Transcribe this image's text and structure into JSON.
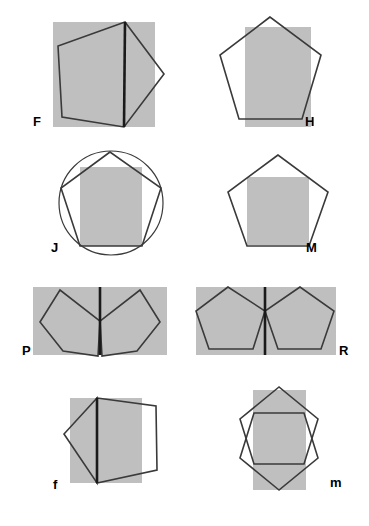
{
  "figure": {
    "width": 369,
    "height": 526,
    "background_color": "#ffffff",
    "fill_color": "#bfbfbf",
    "stroke_color": "#3a3a3a",
    "heavy_stroke_color": "#1a1a1a",
    "panel_count": 8,
    "rows": 4,
    "columns": 2
  },
  "panels": [
    {
      "id": "F",
      "label": "F",
      "label_x": 33,
      "label_y": 126,
      "description": "Gray square with a large pentagon rotated so one vertex points right, plus a heavy vertical chord",
      "rect": {
        "x": 53,
        "y": 22,
        "w": 102,
        "h": 105
      },
      "pentagon": "125,22 58,46 62,117 124,127 164,74",
      "chord": {
        "x1": 125,
        "y1": 22,
        "x2": 124,
        "y2": 127
      }
    },
    {
      "id": "H",
      "label": "H",
      "label_x": 305,
      "label_y": 126,
      "description": "Upright pentagon outline overlapping a tall gray rectangle",
      "rect": {
        "x": 245,
        "y": 27,
        "w": 66,
        "h": 100
      },
      "pentagon": "270,17 220,55 239,119 302,119 321,55",
      "chord": null
    },
    {
      "id": "J",
      "label": "J",
      "label_x": 51,
      "label_y": 252,
      "description": "Circle circumscribing an upright pentagon with a gray rectangle inscribed",
      "rect": {
        "x": 80,
        "y": 167,
        "w": 62,
        "h": 79
      },
      "pentagon": "110,152 61,188 80,246 142,246 161,188",
      "circle": {
        "cx": 111,
        "cy": 203,
        "r": 52
      },
      "chord": null
    },
    {
      "id": "M",
      "label": "M",
      "label_x": 306,
      "label_y": 252,
      "description": "Upright pentagon outline with a gray rectangle sitting in its lower portion",
      "rect": {
        "x": 247,
        "y": 177,
        "w": 62,
        "h": 68
      },
      "pentagon": "278,155 228,192 247,246 309,246 328,192",
      "chord": null
    },
    {
      "id": "P",
      "label": "P",
      "label_x": 22,
      "label_y": 355,
      "description": "Two mirrored pentagons sharing a heavy vertical edge over a wide gray rectangle",
      "rect": {
        "x": 33,
        "y": 287,
        "w": 134,
        "h": 68
      },
      "pentagon": "60,290 40,322 63,351 98,356 100,321",
      "pentagon2": "140,290 160,322 137,351 102,356 100,321",
      "chord": {
        "x1": 100,
        "y1": 287,
        "x2": 100,
        "y2": 355
      }
    },
    {
      "id": "R",
      "label": "R",
      "label_x": 339,
      "label_y": 355,
      "description": "Two pentagons meeting at one point with a heavy vertical line between them",
      "rect": {
        "x": 196,
        "y": 287,
        "w": 140,
        "h": 68
      },
      "pentagon": "228,287 196,311 209,349 253,349 265,311",
      "pentagon2": "300,287 265,311 278,349 321,349 334,311",
      "chord": {
        "x1": 265,
        "y1": 287,
        "x2": 265,
        "y2": 355
      }
    },
    {
      "id": "f",
      "label": "f",
      "label_x": 53,
      "label_y": 489,
      "description": "Narrow gray rectangle with a diamond on the left and a pentagon outline on the right, heavy vertical chord",
      "rect": {
        "x": 70,
        "y": 398,
        "w": 72,
        "h": 85
      },
      "pentagon": "97,398 64,434 97,483 97,398",
      "pentagon2": "97,398 156,406 157,470 97,483",
      "chord": {
        "x1": 97,
        "y1": 398,
        "x2": 97,
        "y2": 483
      }
    },
    {
      "id": "m",
      "label": "m",
      "label_x": 330,
      "label_y": 487,
      "description": "Two overlapping pentagons, one pointing up and one pointing down, over a gray rectangle",
      "rect": {
        "x": 253,
        "y": 390,
        "w": 53,
        "h": 100
      },
      "pentagon": "279,387 240,419 254,464 304,464 318,419",
      "pentagon2": "279,490 240,458 254,413 304,413 318,458",
      "chord": null
    }
  ]
}
